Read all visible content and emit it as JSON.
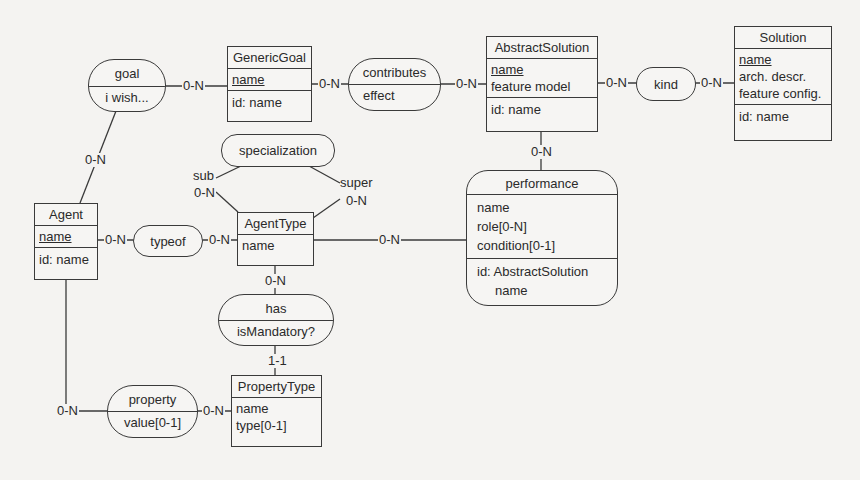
{
  "diagram": {
    "type": "entity-relationship",
    "entities": {
      "generic_goal": {
        "name": "GenericGoal",
        "attributes": [
          "name"
        ],
        "identifier": "id: name"
      },
      "abstract_solution": {
        "name": "AbstractSolution",
        "attributes": [
          "name",
          "feature model"
        ],
        "identifier": "id: name"
      },
      "solution": {
        "name": "Solution",
        "attributes": [
          "name",
          "arch. descr.",
          "feature config."
        ],
        "identifier": "id: name"
      },
      "agent": {
        "name": "Agent",
        "attributes": [
          "name"
        ],
        "identifier": "id: name"
      },
      "agent_type": {
        "name": "AgentType",
        "attributes": [
          "name"
        ]
      },
      "property_type": {
        "name": "PropertyType",
        "attributes": [
          "name",
          "type[0-1]"
        ]
      },
      "performance": {
        "name": "performance",
        "attributes": [
          "name",
          "role[0-N]",
          "condition[0-1]"
        ],
        "identifier": [
          "id: AbstractSolution",
          "name"
        ]
      }
    },
    "relationships": {
      "goal": {
        "name": "goal",
        "attribute": "i wish..."
      },
      "contributes": {
        "name": "contributes",
        "attribute": "effect"
      },
      "kind": {
        "name": "kind"
      },
      "specialization": {
        "name": "specialization",
        "roles": {
          "sub": "sub",
          "super": "super"
        }
      },
      "typeof": {
        "name": "typeof"
      },
      "has": {
        "name": "has",
        "attribute": "isMandatory?"
      },
      "property": {
        "name": "property",
        "attribute": "value[0-1]"
      }
    },
    "cardinalities": {
      "goal_genericgoal": "0-N",
      "goal_agent": "0-N",
      "genericgoal_contributes": "0-N",
      "contributes_abstractsolution": "0-N",
      "abstractsolution_kind": "0-N",
      "kind_solution": "0-N",
      "abstractsolution_performance": "0-N",
      "specialization_sub": "0-N",
      "specialization_super": "0-N",
      "agent_typeof": "0-N",
      "typeof_agenttype": "0-N",
      "agenttype_performance": "0-N",
      "agenttype_has": "0-N",
      "has_propertytype": "1-1",
      "agent_property": "0-N",
      "property_propertytype": "0-N"
    }
  }
}
